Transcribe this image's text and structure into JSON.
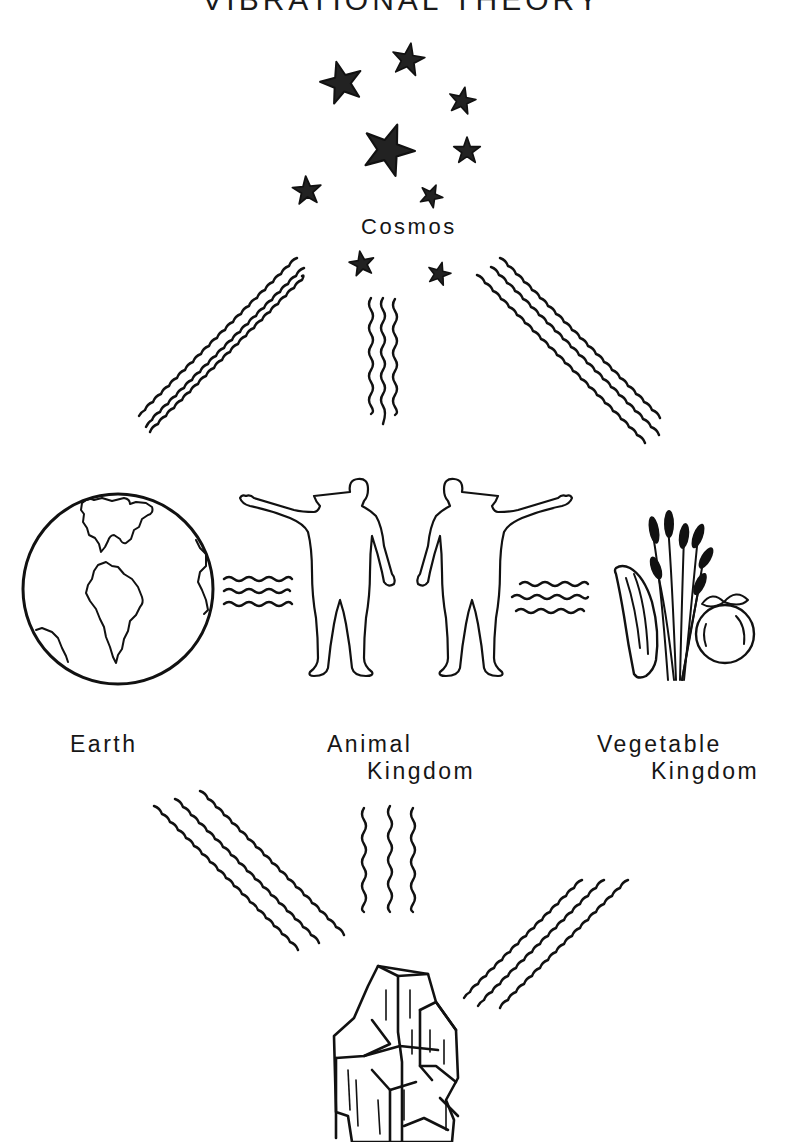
{
  "diagram": {
    "title": "VIBRATIONAL THEORY",
    "nodes": {
      "cosmos": {
        "label": "Cosmos",
        "icon": "stars-icon"
      },
      "earth": {
        "label": "Earth",
        "icon": "globe-icon"
      },
      "animal": {
        "label_line1": "Animal",
        "label_line2": "Kingdom",
        "icon": "human-figures-icon"
      },
      "vegetable": {
        "label_line1": "Vegetable",
        "label_line2": "Kingdom",
        "icon": "plants-icon"
      },
      "mineral": {
        "label": "",
        "icon": "crystal-icon"
      }
    },
    "connections": [
      {
        "from": "cosmos",
        "to": "earth",
        "style": "wavy-lines",
        "count": 3
      },
      {
        "from": "cosmos",
        "to": "animal",
        "style": "wavy-lines",
        "count": 3
      },
      {
        "from": "cosmos",
        "to": "vegetable",
        "style": "wavy-lines",
        "count": 3
      },
      {
        "from": "earth",
        "to": "animal",
        "style": "wavy-lines",
        "count": 3
      },
      {
        "from": "animal",
        "to": "vegetable",
        "style": "wavy-lines",
        "count": 3
      },
      {
        "from": "earth",
        "to": "mineral",
        "style": "wavy-lines",
        "count": 3
      },
      {
        "from": "animal",
        "to": "mineral",
        "style": "wavy-lines",
        "count": 3
      },
      {
        "from": "vegetable",
        "to": "mineral",
        "style": "wavy-lines",
        "count": 3
      }
    ],
    "colors": {
      "ink": "#111111",
      "paper": "#ffffff"
    }
  }
}
